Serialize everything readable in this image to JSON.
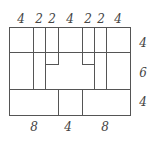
{
  "diagram": {
    "type": "rectangle-partition",
    "top_widths": [
      "4",
      "2",
      "2",
      "4",
      "2",
      "2",
      "4"
    ],
    "right_heights": [
      "4",
      "6",
      "4"
    ],
    "bottom_widths": [
      "8",
      "4",
      "8"
    ],
    "line_color": "#555555",
    "label_color": "#444444"
  }
}
